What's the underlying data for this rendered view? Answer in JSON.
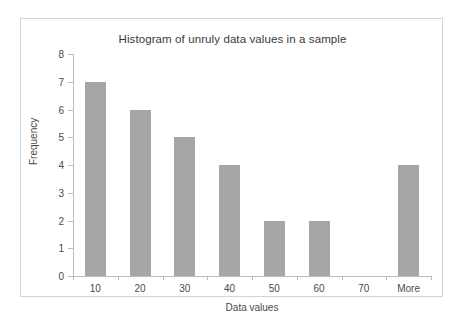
{
  "chart_data": {
    "type": "bar",
    "title": "Histogram of unruly data values in a sample",
    "xlabel": "Data values",
    "ylabel": "Frequency",
    "categories": [
      "10",
      "20",
      "30",
      "40",
      "50",
      "60",
      "70",
      "More"
    ],
    "values": [
      7,
      6,
      5,
      4,
      2,
      2,
      0,
      4
    ],
    "ylim": [
      0,
      8
    ],
    "yticks": [
      "0",
      "1",
      "2",
      "3",
      "4",
      "5",
      "6",
      "7",
      "8"
    ],
    "grid": false,
    "legend": false,
    "bar_color": "#a6a6a6",
    "axis_color": "#bdbdbd",
    "border_color": "#d4d4d4"
  }
}
